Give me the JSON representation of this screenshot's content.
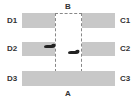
{
  "diagram": {
    "top_label": "B",
    "bottom_label": "A",
    "left_labels": [
      "D1",
      "D2",
      "D3"
    ],
    "right_labels": [
      "C1",
      "C2",
      "C3"
    ],
    "colors": {
      "bar": "#c8c8c8",
      "dashed_border": "#888888",
      "label": "#333333",
      "footprint": "#222222"
    },
    "icons": [
      "footprint-icon",
      "footprint-icon"
    ]
  }
}
